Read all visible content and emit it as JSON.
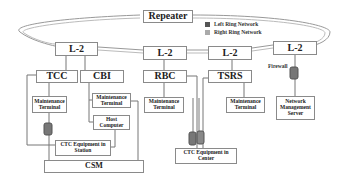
{
  "diagram": {
    "repeater": "Repeater",
    "legend": [
      {
        "label": "Left Ring Network",
        "color": "#555555"
      },
      {
        "label": "Right Ring Network",
        "color": "#aaaaaa"
      }
    ],
    "switches": [
      "L-2",
      "L-2",
      "L-2",
      "L-2"
    ],
    "systems": {
      "tcc": "TCC",
      "cbi": "CBI",
      "rbc": "RBC",
      "tsrs": "TSRS"
    },
    "maintenance_terminal": "Maintenance Terminal",
    "host_computer": "Host Computer",
    "ctc_station": "CTC Equipment in Station",
    "ctc_center": "CTC Equipment in Center",
    "csm": "CSM",
    "firewall": "Firewall",
    "nms": "Network Management Server"
  }
}
